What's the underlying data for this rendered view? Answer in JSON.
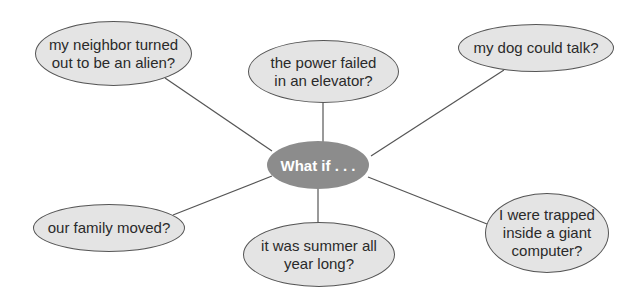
{
  "center": {
    "label": "What if . . ."
  },
  "nodes": [
    {
      "id": "alien",
      "label": "my neighbor turned out to be an alien?"
    },
    {
      "id": "elevator",
      "label": "the power failed in an elevator?"
    },
    {
      "id": "dog",
      "label": "my dog could talk?"
    },
    {
      "id": "family",
      "label": "our family moved?"
    },
    {
      "id": "summer",
      "label": "it was summer all year long?"
    },
    {
      "id": "computer",
      "label": "I were trapped inside a giant computer?"
    }
  ],
  "colors": {
    "center_fill": "#8c8c8c",
    "bubble_fill": "#e4e4e4",
    "line": "#555555"
  }
}
